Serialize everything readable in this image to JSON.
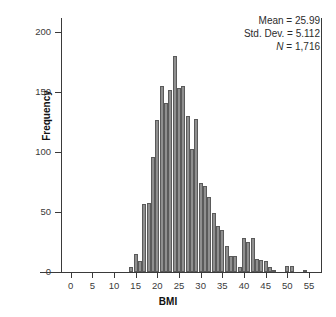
{
  "chart_data": {
    "type": "bar",
    "title": "",
    "xlabel": "BMI",
    "ylabel": "Frequency",
    "xlim": [
      -2,
      58
    ],
    "ylim": [
      0,
      212
    ],
    "grid": false,
    "bin_width": 1,
    "xticks": [
      0,
      5,
      10,
      15,
      20,
      25,
      30,
      35,
      40,
      45,
      50,
      55
    ],
    "yticks": [
      0,
      50,
      100,
      150,
      200
    ],
    "xtick_labels": [
      "0",
      "5",
      "10",
      "15",
      "20",
      "25",
      "30",
      "35",
      "40",
      "45",
      "50",
      "55"
    ],
    "ytick_labels": [
      "0",
      "50",
      "100",
      "150",
      "200"
    ],
    "categories": [
      14,
      15,
      16,
      17,
      18,
      19,
      20,
      21,
      22,
      23,
      24,
      25,
      26,
      27,
      28,
      29,
      30,
      31,
      32,
      33,
      34,
      35,
      36,
      37,
      38,
      39,
      40,
      41,
      42,
      43,
      44,
      45,
      46,
      47,
      50,
      51,
      54
    ],
    "values": [
      4,
      15,
      9,
      57,
      58,
      96,
      127,
      155,
      141,
      152,
      180,
      154,
      155,
      130,
      103,
      128,
      74,
      72,
      63,
      49,
      38,
      35,
      22,
      13,
      13,
      4,
      28,
      25,
      28,
      11,
      10,
      9,
      4,
      2,
      5,
      5,
      2
    ],
    "bar_color": "#8f8f8f",
    "bar_edge_color": "#5a5a5a"
  },
  "annotations": {
    "mean_label": "Mean = 25.99",
    "sd_label": "Std. Dev. = 5.112",
    "n_label_prefix": "N",
    "n_label_value": " = 1,716"
  }
}
